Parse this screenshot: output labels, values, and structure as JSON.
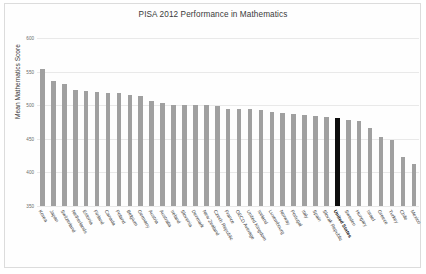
{
  "chart_data": {
    "type": "bar",
    "title": "PISA 2012 Performance in Mathematics",
    "xlabel": "",
    "ylabel": "Mean Mathematics Score",
    "ylim": [
      350,
      600
    ],
    "yticks": [
      350,
      400,
      450,
      500,
      550,
      600
    ],
    "ytick_labels": [
      "350",
      "400",
      "450",
      "500",
      "550",
      "600"
    ],
    "grid": true,
    "legend": "none",
    "bar_color": "#a0a0a0",
    "highlight_color": "#0d0d0d",
    "highlight_category": "United States",
    "categories": [
      "Korea",
      "Japan",
      "Switzerland",
      "Netherlands",
      "Estonia",
      "Finland",
      "Canada",
      "Poland",
      "Belgium",
      "Germany",
      "Austria",
      "Australia",
      "Ireland",
      "Slovenia",
      "Denmark",
      "New Zealand",
      "Czech Republic",
      "France",
      "OECD Average",
      "United Kingdom",
      "Iceland",
      "Luxembourg",
      "Norway",
      "Portugal",
      "Italy",
      "Spain",
      "Slovak Republic",
      "United States",
      "Sweden",
      "Hungary",
      "Israel",
      "Greece",
      "Turkey",
      "Chile",
      "Mexico"
    ],
    "values": [
      554,
      536,
      531,
      523,
      521,
      519,
      518,
      518,
      515,
      514,
      506,
      504,
      501,
      501,
      500,
      500,
      499,
      495,
      494,
      494,
      493,
      490,
      489,
      487,
      485,
      484,
      482,
      481,
      478,
      477,
      466,
      453,
      448,
      423,
      413
    ]
  }
}
